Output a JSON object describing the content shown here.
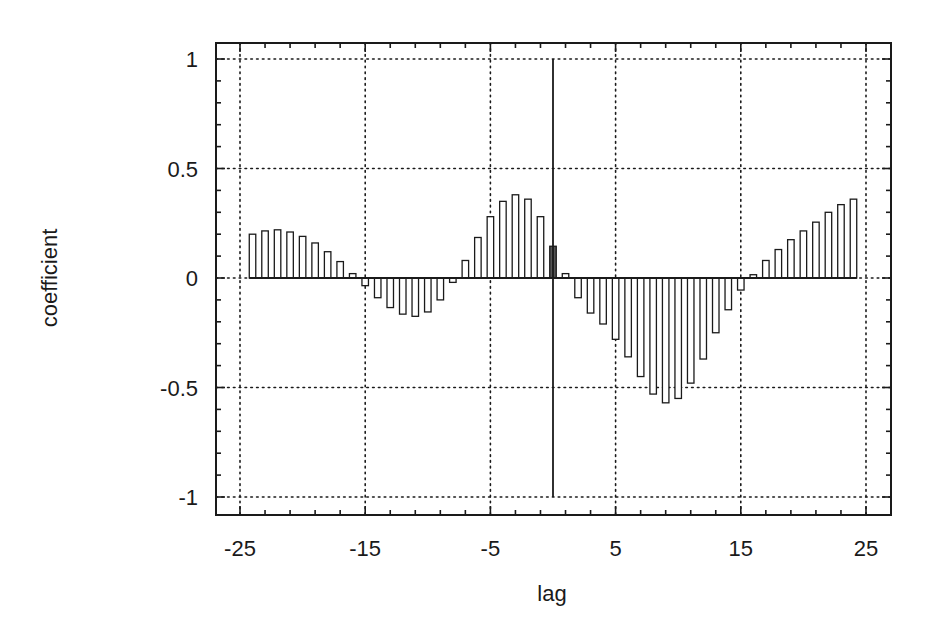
{
  "chart_data": {
    "type": "bar",
    "title": "",
    "xlabel": "lag",
    "ylabel": "coefficient",
    "xlim": [
      -27.0,
      27.0
    ],
    "ylim": [
      -1.15,
      1.08
    ],
    "x_ticks": [
      -25,
      -15,
      -5,
      5,
      15,
      25
    ],
    "x_tick_labels": [
      "-25",
      "-15",
      "-5",
      "5",
      "15",
      "25"
    ],
    "x_minor_step": 2,
    "y_ticks": [
      1,
      0.5,
      0,
      -0.5,
      -1
    ],
    "y_tick_labels": [
      "1",
      "0.5",
      "0",
      "-0.5",
      "-1"
    ],
    "y_minor_step": 0.1,
    "grid": true,
    "grid_style": "dotted",
    "legend": null,
    "x": [
      -24,
      -23,
      -22,
      -21,
      -20,
      -19,
      -18,
      -17,
      -16,
      -15,
      -14,
      -13,
      -12,
      -11,
      -10,
      -9,
      -8,
      -7,
      -6,
      -5,
      -4,
      -3,
      -2,
      -1,
      0,
      1,
      2,
      3,
      4,
      5,
      6,
      7,
      8,
      9,
      10,
      11,
      12,
      13,
      14,
      15,
      16,
      17,
      18,
      19,
      20,
      21,
      22,
      23,
      24
    ],
    "values": [
      0.2,
      0.215,
      0.22,
      0.21,
      0.19,
      0.16,
      0.12,
      0.075,
      0.02,
      -0.035,
      -0.09,
      -0.135,
      -0.165,
      -0.175,
      -0.155,
      -0.1,
      -0.02,
      0.08,
      0.185,
      0.28,
      0.35,
      0.38,
      0.36,
      0.28,
      0.145,
      0.02,
      -0.09,
      -0.16,
      -0.21,
      -0.28,
      -0.36,
      -0.45,
      -0.53,
      -0.57,
      -0.55,
      -0.48,
      -0.37,
      -0.25,
      -0.145,
      -0.055,
      0.015,
      0.08,
      0.13,
      0.175,
      0.215,
      0.255,
      0.3,
      0.335,
      0.36
    ],
    "highlight_bar_lag": 0,
    "vertical_marker": {
      "x": 0,
      "y_from": -1,
      "y_to": 1
    }
  },
  "colors": {
    "ink": "#1a1a1a",
    "background": "#ffffff"
  }
}
